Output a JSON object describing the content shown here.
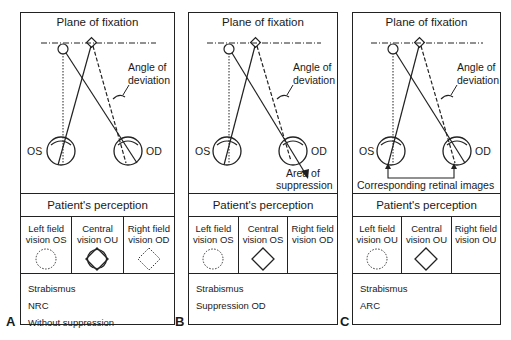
{
  "figure": {
    "panels": [
      {
        "id": "A",
        "title": "Plane of fixation",
        "angle_label_1": "Angle of",
        "angle_label_2": "deviation",
        "left_eye": "OS",
        "right_eye": "OD",
        "extra_label_1": "",
        "extra_label_2": "",
        "perception_header": "Patient's perception",
        "cells": [
          {
            "line1": "Left field",
            "line2": "vision OS",
            "shape": "dotted-circle"
          },
          {
            "line1": "Central",
            "line2": "vision OU",
            "shape": "circle-and-diamond"
          },
          {
            "line1": "Right field",
            "line2": "vision OD",
            "shape": "dotted-diamond"
          }
        ],
        "notes": [
          "Strabismus",
          "NRC",
          "Without suppression"
        ]
      },
      {
        "id": "B",
        "title": "Plane of fixation",
        "angle_label_1": "Angle of",
        "angle_label_2": "deviation",
        "left_eye": "OS",
        "right_eye": "OD",
        "extra_label_1": "Area of",
        "extra_label_2": "suppression",
        "perception_header": "Patient's perception",
        "cells": [
          {
            "line1": "Left field",
            "line2": "vision OS",
            "shape": "dotted-circle"
          },
          {
            "line1": "Central",
            "line2": "vision OS",
            "shape": "diamond"
          },
          {
            "line1": "Right field",
            "line2": "vision OD",
            "shape": "none"
          }
        ],
        "notes": [
          "Strabismus",
          "Suppression OD"
        ]
      },
      {
        "id": "C",
        "title": "Plane of fixation",
        "angle_label_1": "Angle of",
        "angle_label_2": "deviation",
        "left_eye": "OS",
        "right_eye": "OD",
        "extra_label_1": "Corresponding retinal images",
        "extra_label_2": "",
        "perception_header": "Patient's perception",
        "cells": [
          {
            "line1": "Left field",
            "line2": "vision OU",
            "shape": "dotted-circle"
          },
          {
            "line1": "Central",
            "line2": "vision OU",
            "shape": "diamond"
          },
          {
            "line1": "Right field",
            "line2": "vision OU",
            "shape": "none"
          }
        ],
        "notes": [
          "Strabismus",
          "ARC"
        ]
      }
    ]
  }
}
